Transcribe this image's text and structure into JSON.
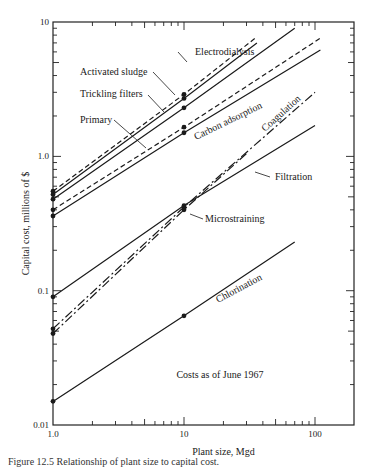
{
  "chart_data": {
    "type": "line",
    "title": "",
    "xlabel": "Plant size, Mgd",
    "ylabel": "Capital cost, millions of $",
    "xscale": "log",
    "yscale": "log",
    "xlim": [
      1.0,
      200
    ],
    "ylim": [
      0.01,
      10
    ],
    "x_tick_labels": [
      "1.0",
      "10",
      "100"
    ],
    "y_tick_labels": [
      "0.01",
      "0.1",
      "1.0",
      "10"
    ],
    "grid": false,
    "legend": "inline labels",
    "annotation": "Costs as of June 1967",
    "series": [
      {
        "name": "Activated sludge",
        "style": "dashed",
        "x": [
          1,
          10,
          35
        ],
        "y": [
          0.55,
          2.9,
          7.6
        ]
      },
      {
        "name": "Trickling filters",
        "style": "solid",
        "x": [
          1,
          10,
          36
        ],
        "y": [
          0.52,
          2.7,
          7.0
        ]
      },
      {
        "name": "Electrodialysis",
        "style": "solid",
        "x": [
          1,
          10,
          70
        ],
        "y": [
          0.48,
          2.3,
          9.0
        ]
      },
      {
        "name": "Primary",
        "style": "dashed",
        "x": [
          1,
          10,
          110
        ],
        "y": [
          0.4,
          1.65,
          7.6
        ]
      },
      {
        "name": "Carbon adsorption",
        "style": "solid",
        "x": [
          1,
          10,
          110
        ],
        "y": [
          0.36,
          1.5,
          6.2
        ]
      },
      {
        "name": "Coagulation",
        "style": "dash-dot",
        "x": [
          1,
          10,
          100
        ],
        "y": [
          0.052,
          0.42,
          3.0
        ]
      },
      {
        "name": "Filtration",
        "style": "solid",
        "x": [
          1,
          10,
          100
        ],
        "y": [
          0.09,
          0.43,
          1.7
        ]
      },
      {
        "name": "Microstraining",
        "style": "dash-dot",
        "x": [
          1,
          10,
          30
        ],
        "y": [
          0.048,
          0.4,
          1.05
        ]
      },
      {
        "name": "Chlorination",
        "style": "solid-dashed",
        "x": [
          1,
          10,
          70
        ],
        "y": [
          0.015,
          0.065,
          0.23
        ]
      }
    ]
  },
  "caption": "Figure 12.5 Relationship of plant size to capital cost."
}
